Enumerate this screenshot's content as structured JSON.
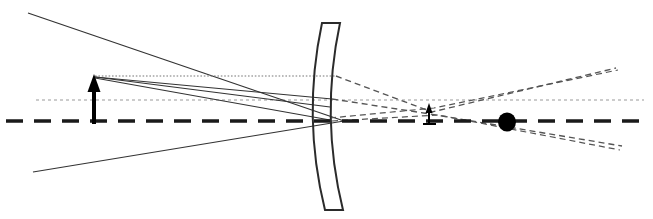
{
  "figure": {
    "type": "optics-ray-diagram",
    "title": "",
    "width": 653,
    "height": 219,
    "background": "#ffffff",
    "description": "Ray diagram of a concave (meniscus) lens element with an upright object arrow on the left, solid incident rays, dotted construction lines, and dashed virtual/refracted rays converging to a small inverted-scale image arrow and continuing to a filled dot on the optical axis at the right."
  },
  "colors": {
    "ray_solid": "#333333",
    "ray_dashed": "#555555",
    "axis_bold": "#1a1a1a",
    "axis_thin": "#9a9a9a",
    "construction_dotted": "#777777",
    "lens_outline": "#2b2b2b",
    "object_arrow": "#000000",
    "image_arrow": "#000000",
    "point_dot": "#000000"
  },
  "axes": {
    "optical_axis_bold": {
      "label": "optical-axis",
      "y": 121,
      "x_start": 6,
      "x_end": 648,
      "stroke_width": 3.6,
      "dash": "17 11"
    },
    "auxiliary_axis_thin": {
      "label": "auxiliary-axis",
      "y": 100,
      "x_start": 36,
      "x_end": 644,
      "stroke_width": 1.1,
      "dash": "3 3"
    }
  },
  "lens": {
    "name": "concave-meniscus-lens",
    "front_surface": {
      "top": [
        322,
        23
      ],
      "control": [
        302,
        117
      ],
      "bottom": [
        325,
        210
      ]
    },
    "back_surface": {
      "top": [
        340,
        23
      ],
      "control": [
        320,
        117
      ],
      "bottom": [
        343,
        210
      ]
    },
    "vertex_x": 320,
    "top_y": 23,
    "bottom_y": 210,
    "stroke_width": 2.0
  },
  "object": {
    "name": "object-arrow",
    "x": 94,
    "base_y": 122,
    "tip_y": 76,
    "height_px": 46,
    "shaft_width": 4,
    "head_width": 13,
    "head_height": 16
  },
  "image": {
    "name": "image-arrow",
    "x": 429,
    "base_y": 122,
    "tip_y": 104,
    "height_px": 18,
    "shaft_width": 2,
    "head_width": 7,
    "head_height": 9
  },
  "focal_point": {
    "name": "focal-point-dot",
    "cx": 507,
    "cy": 122,
    "rx": 9,
    "ry": 9.5
  },
  "chart_data": {
    "type": "line",
    "xlabel": "",
    "ylabel": "",
    "xlim": [
      0,
      653
    ],
    "ylim": [
      0,
      219
    ],
    "grid": false,
    "legend": "none",
    "series": [
      {
        "name": "incident-upper-divergent-ray",
        "style": "solid",
        "points": [
          [
            28,
            13
          ],
          [
            344,
            121
          ]
        ]
      },
      {
        "name": "incident-lower-divergent-ray",
        "style": "solid",
        "points": [
          [
            33,
            172
          ],
          [
            344,
            121
          ]
        ]
      },
      {
        "name": "object-tip-parallel-ray-dotted",
        "style": "dotted",
        "points": [
          [
            95,
            76
          ],
          [
            336,
            76
          ]
        ]
      },
      {
        "name": "object-tip-ray-to-lens-upper",
        "style": "solid",
        "points": [
          [
            95,
            77
          ],
          [
            332,
            99
          ]
        ]
      },
      {
        "name": "object-tip-ray-to-lens-mid",
        "style": "solid",
        "points": [
          [
            95,
            77
          ],
          [
            330,
            107
          ]
        ]
      },
      {
        "name": "object-tip-ray-to-lens-axis",
        "style": "solid",
        "points": [
          [
            95,
            78
          ],
          [
            330,
            120
          ]
        ]
      },
      {
        "name": "refracted-upper-ray-dashed",
        "style": "dashed",
        "points": [
          [
            336,
            76
          ],
          [
            432,
            112
          ],
          [
            616,
            68
          ]
        ]
      },
      {
        "name": "refracted-mid-ray-dashed",
        "style": "dashed",
        "points": [
          [
            332,
            99
          ],
          [
            430,
            114
          ],
          [
            622,
            146
          ]
        ]
      },
      {
        "name": "refracted-lower-ray-dashed",
        "style": "dashed",
        "points": [
          [
            330,
            118
          ],
          [
            434,
            108
          ],
          [
            618,
            70
          ]
        ]
      },
      {
        "name": "refracted-axis-ray-dashed",
        "style": "dashed",
        "points": [
          [
            332,
            121
          ],
          [
            438,
            115
          ],
          [
            620,
            150
          ]
        ]
      }
    ],
    "markers": [
      {
        "name": "focal-point-dot",
        "x": 507,
        "y": 122,
        "shape": "filled-circle"
      },
      {
        "name": "object-arrow-tip",
        "x": 94,
        "y": 76,
        "shape": "arrow-up"
      },
      {
        "name": "image-arrow-tip",
        "x": 429,
        "y": 104,
        "shape": "arrow-up"
      }
    ],
    "annotations": []
  }
}
